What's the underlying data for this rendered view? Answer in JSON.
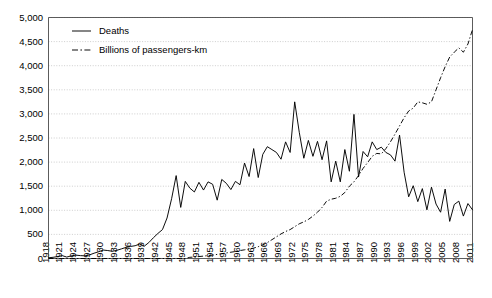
{
  "chart_data": {
    "type": "line",
    "title": "",
    "subtitle": "",
    "xlabel": "",
    "ylabel": "",
    "grid": true,
    "legend_position": "top-left",
    "xlim": [
      1918,
      2011
    ],
    "ylim": [
      0,
      5000
    ],
    "ytick_step": 500,
    "xtick_step": 3,
    "ytick_labels": [
      "0",
      "500",
      "1,000",
      "1,500",
      "2,000",
      "2,500",
      "3,000",
      "3,500",
      "4,000",
      "4,500",
      "5,000"
    ],
    "ytick_values": [
      0,
      500,
      1000,
      1500,
      2000,
      2500,
      3000,
      3500,
      4000,
      4500,
      5000
    ],
    "xtick_labels": [
      "1918",
      "1921",
      "1924",
      "1927",
      "1930",
      "1933",
      "1936",
      "1939",
      "1942",
      "1945",
      "1948",
      "1951",
      "1954",
      "1957",
      "1960",
      "1963",
      "1966",
      "1969",
      "1972",
      "1975",
      "1978",
      "1981",
      "1984",
      "1987",
      "1990",
      "1993",
      "1996",
      "1999",
      "2002",
      "2005",
      "2008",
      "2011"
    ],
    "x": [
      1918,
      1919,
      1920,
      1921,
      1922,
      1923,
      1924,
      1925,
      1926,
      1927,
      1928,
      1929,
      1930,
      1931,
      1932,
      1933,
      1934,
      1935,
      1936,
      1937,
      1938,
      1939,
      1940,
      1941,
      1942,
      1943,
      1944,
      1945,
      1946,
      1947,
      1948,
      1949,
      1950,
      1951,
      1952,
      1953,
      1954,
      1955,
      1956,
      1957,
      1958,
      1959,
      1960,
      1961,
      1962,
      1963,
      1964,
      1965,
      1966,
      1967,
      1968,
      1969,
      1970,
      1971,
      1972,
      1973,
      1974,
      1975,
      1976,
      1977,
      1978,
      1979,
      1980,
      1981,
      1982,
      1983,
      1984,
      1985,
      1986,
      1987,
      1988,
      1989,
      1990,
      1991,
      1992,
      1993,
      1994,
      1995,
      1996,
      1997,
      1998,
      1999,
      2000,
      2001,
      2002,
      2003,
      2004,
      2005,
      2006,
      2007,
      2008,
      2009,
      2010,
      2011
    ],
    "series": [
      {
        "name": "Deaths",
        "style": "solid",
        "color": "#000000",
        "values": [
          15,
          25,
          40,
          60,
          30,
          55,
          70,
          60,
          55,
          75,
          110,
          140,
          175,
          165,
          150,
          170,
          200,
          230,
          250,
          265,
          300,
          255,
          330,
          430,
          520,
          600,
          840,
          1240,
          1720,
          1060,
          1600,
          1460,
          1380,
          1580,
          1420,
          1590,
          1540,
          1210,
          1640,
          1560,
          1430,
          1600,
          1530,
          1980,
          1700,
          2280,
          1680,
          2160,
          2320,
          2260,
          2200,
          2060,
          2420,
          2200,
          3250,
          2620,
          2080,
          2450,
          2120,
          2430,
          2050,
          2440,
          1590,
          2020,
          1590,
          2260,
          1810,
          2990,
          1690,
          2220,
          2110,
          2420,
          2260,
          2310,
          2200,
          2150,
          2020,
          2560,
          1790,
          1280,
          1510,
          1180,
          1450,
          1010,
          1480,
          1130,
          960,
          1440,
          770,
          1120,
          1190,
          880,
          1140,
          1010
        ]
      },
      {
        "name": "Billions of passengers-km",
        "style": "dashdot",
        "color": "#000000",
        "values": [
          0,
          0,
          0,
          0,
          0,
          0,
          0,
          0,
          0,
          0,
          0,
          0,
          0,
          0,
          0,
          0,
          0,
          0,
          0,
          0,
          0,
          0,
          0,
          0,
          0,
          0,
          0,
          0,
          0,
          0,
          0,
          25,
          30,
          40,
          50,
          60,
          70,
          85,
          100,
          115,
          130,
          145,
          165,
          180,
          195,
          215,
          245,
          285,
          330,
          390,
          450,
          510,
          560,
          600,
          660,
          720,
          760,
          810,
          880,
          960,
          1060,
          1190,
          1230,
          1250,
          1290,
          1370,
          1500,
          1590,
          1720,
          1870,
          1990,
          2120,
          2180,
          2170,
          2280,
          2420,
          2580,
          2750,
          2920,
          3060,
          3120,
          3250,
          3230,
          3200,
          3250,
          3500,
          3750,
          3980,
          4180,
          4280,
          4370,
          4280,
          4450,
          4750
        ]
      }
    ]
  },
  "legend": {
    "items": [
      {
        "label": "Deaths",
        "style": "solid"
      },
      {
        "label": "Billions of passengers-km",
        "style": "dashdot"
      }
    ]
  }
}
